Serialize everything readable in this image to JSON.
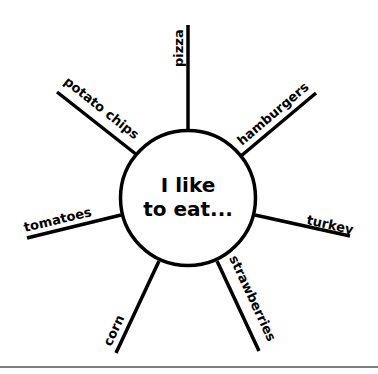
{
  "diagram": {
    "type": "web / spider map",
    "center_text": {
      "line1": "I like",
      "line2": "to eat..."
    },
    "spokes": [
      {
        "label": "pizza"
      },
      {
        "label": "hamburgers"
      },
      {
        "label": "turkey"
      },
      {
        "label": "strawberries"
      },
      {
        "label": "corn"
      },
      {
        "label": "tomatoes"
      },
      {
        "label": "potato chips"
      }
    ],
    "colors": {
      "line": "#000000",
      "background": "#ffffff",
      "rule": "#555555"
    }
  }
}
